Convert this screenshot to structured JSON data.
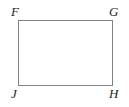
{
  "figure": {
    "name": "rectangle-FGHJ",
    "shape_type": "rectangle",
    "background_color": "#ffffff",
    "stroke_color": "#808285",
    "stroke_width": 1,
    "label_color": "#231f20",
    "vertices": [
      {
        "id": "F",
        "label": "F",
        "position": "top-left",
        "x": 18.5,
        "y": 20.5
      },
      {
        "id": "G",
        "label": "G",
        "position": "top-right",
        "x": 112.5,
        "y": 20.5
      },
      {
        "id": "H",
        "label": "H",
        "position": "bottom-right",
        "x": 112.5,
        "y": 85.5
      },
      {
        "id": "J",
        "label": "J",
        "position": "bottom-left",
        "x": 18.5,
        "y": 85.5
      }
    ],
    "outline_points": "18.5,20.5 112.5,20.5 112.5,85.5 18.5,85.5 18.5,20.5"
  }
}
